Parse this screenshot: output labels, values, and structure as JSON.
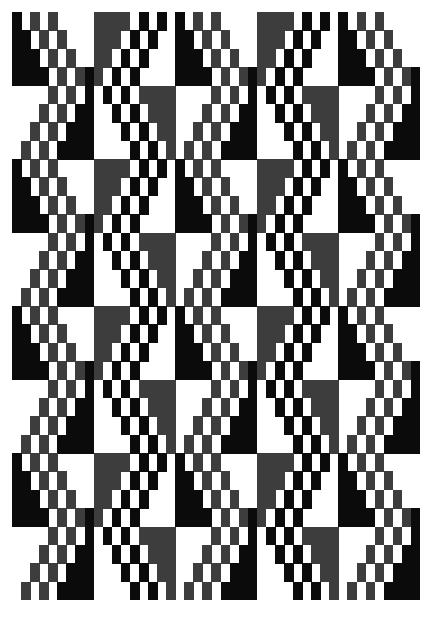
{
  "artwork": {
    "type": "geometric-op-art-pattern",
    "colors": {
      "black": "#0b0b0b",
      "gray": "#3d3d3d",
      "white": "#ffffff"
    },
    "tile_columns": 5,
    "tile_rows": 8,
    "cells_per_tile_x": 9,
    "cells_per_tile_y": 4,
    "tiles": {
      "A_A": [
        "K.G.G....",
        "KK.G.G...",
        "KKK.G.G..",
        "KKKK.G.GK"
      ],
      "A_B": [
        "....G.G.K",
        "...G.G.KK",
        "..G.G.KKK",
        ".G.G.KKKK"
      ],
      "B_A": [
        "GGGG.K.K.",
        "GGG.K.K..",
        "GG.K.K...",
        "G.K.K...."
      ],
      "B_B": [
        ".K.K.GGGG",
        "..K.K.GGG",
        "...K.K.GG",
        "....K.K.G"
      ]
    },
    "column_kinds": [
      "A",
      "B",
      "A",
      "B",
      "A"
    ],
    "row_kinds": [
      "A",
      "B",
      "A",
      "B",
      "A",
      "B",
      "A",
      "B"
    ]
  }
}
